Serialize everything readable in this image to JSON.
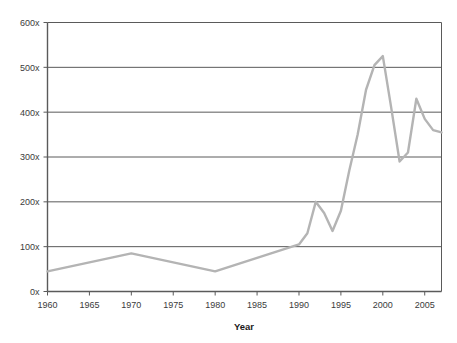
{
  "chart_data": {
    "type": "line",
    "title": "",
    "xlabel": "Year",
    "ylabel": "",
    "xlim": [
      1960,
      2007
    ],
    "ylim": [
      0,
      600
    ],
    "grid": true,
    "legend": false,
    "y_tick_labels": [
      "600x",
      "500x",
      "400x",
      "300x",
      "200x",
      "100x",
      "0x"
    ],
    "y_ticks": [
      600,
      500,
      400,
      300,
      200,
      100,
      0
    ],
    "x_tick_labels": [
      "1960",
      "1965",
      "1970",
      "1975",
      "1980",
      "1985",
      "1990",
      "1995",
      "2000",
      "2005"
    ],
    "x_ticks": [
      1960,
      1965,
      1970,
      1975,
      1980,
      1985,
      1990,
      1995,
      2000,
      2005
    ],
    "series": [
      {
        "name": "",
        "color": "#b4b4b4",
        "x": [
          1960,
          1970,
          1980,
          1985,
          1990,
          1991,
          1992,
          1993,
          1994,
          1995,
          1996,
          1997,
          1998,
          1999,
          2000,
          2001,
          2002,
          2003,
          2004,
          2005,
          2006,
          2007
        ],
        "y": [
          45,
          85,
          45,
          75,
          105,
          130,
          200,
          175,
          135,
          180,
          270,
          350,
          450,
          505,
          525,
          410,
          290,
          310,
          430,
          385,
          360,
          355
        ]
      }
    ]
  },
  "axes": {
    "x_title": "Year"
  },
  "colors": {
    "line": "#b4b4b4",
    "grid": "#5a5a5a",
    "axis": "#5a5a5a",
    "text": "#3b3b3b",
    "background": "#ffffff"
  }
}
